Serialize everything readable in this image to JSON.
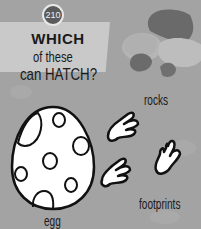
{
  "page_number": "210",
  "title": {
    "emphasis": "WHICH",
    "line1_rest": "of these",
    "line2": "can HATCH?"
  },
  "items": [
    {
      "id": "rocks",
      "label": "rocks",
      "icon": "rocks-icon"
    },
    {
      "id": "egg",
      "label": "egg",
      "icon": "egg-icon"
    },
    {
      "id": "footprints",
      "label": "footprints",
      "icon": "footprints-icon"
    }
  ],
  "colors": {
    "background": "#a3a3a3",
    "title_panel": "#c9c9c9",
    "ink": "#1a1a1a"
  }
}
